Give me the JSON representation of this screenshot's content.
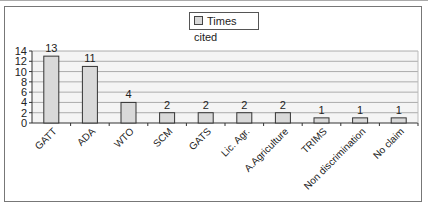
{
  "chart_data": {
    "type": "bar",
    "title": "",
    "xlabel": "",
    "ylabel": "",
    "ylim": [
      0,
      14
    ],
    "yticks": [
      0,
      2,
      4,
      6,
      8,
      10,
      12,
      14
    ],
    "grid": true,
    "legend_position": "top",
    "categories": [
      "GATT",
      "ADA",
      "WTO",
      "SCM",
      "GATS",
      "Lic. Agr.",
      "A.Agriculture",
      "TRIMS",
      "Non discrimination",
      "No claim"
    ],
    "series": [
      {
        "name": "Times cited",
        "values": [
          13,
          11,
          4,
          2,
          2,
          2,
          2,
          1,
          1,
          1
        ]
      }
    ],
    "data_labels": [
      "13",
      "11",
      "4",
      "2",
      "2",
      "2",
      "2",
      "1",
      "1",
      "1"
    ]
  },
  "legend": {
    "label": "Times cited"
  },
  "colors": {
    "bar_fill": "#d9d9d9",
    "bar_stroke": "#333333",
    "grid": "#999999"
  }
}
